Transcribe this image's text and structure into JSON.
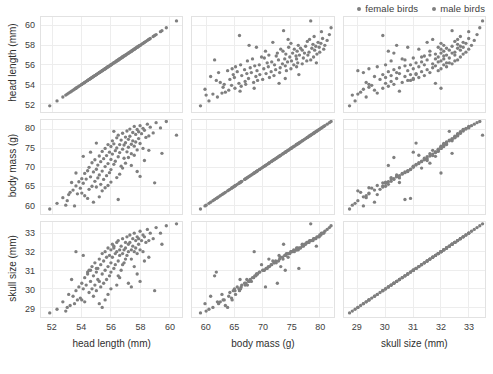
{
  "legend": {
    "position": "top-right",
    "color": "#7f7f7f",
    "entries": [
      {
        "label": "female birds",
        "marker": "dot-icon"
      },
      {
        "label": "male birds",
        "marker": "dot-icon"
      }
    ]
  },
  "chart_data": {
    "type": "scatter",
    "title": "",
    "layout": "scatterplot-matrix",
    "grid": true,
    "point_color": "#7f7f7f",
    "variables": [
      {
        "key": "head_length",
        "label": "head length (mm)",
        "ticks": [
          52,
          54,
          56,
          58,
          60
        ],
        "lim": [
          51.2,
          60.9
        ]
      },
      {
        "key": "body_mass",
        "label": "body mass (g)",
        "ticks": [
          60,
          65,
          70,
          75,
          80
        ],
        "lim": [
          57.5,
          82.5
        ]
      },
      {
        "key": "skull_size",
        "label": "skull size (mm)",
        "ticks": [
          29,
          30,
          31,
          32,
          33
        ],
        "lim": [
          28.5,
          33.6
        ]
      }
    ],
    "observations": [
      [
        51.8,
        59.0,
        28.7
      ],
      [
        52.3,
        60.5,
        28.9
      ],
      [
        52.7,
        62.0,
        29.3
      ],
      [
        53.0,
        61.2,
        29.0
      ],
      [
        53.2,
        63.4,
        29.1
      ],
      [
        53.4,
        64.0,
        29.6
      ],
      [
        53.5,
        59.8,
        29.2
      ],
      [
        53.6,
        65.1,
        29.9
      ],
      [
        53.7,
        63.0,
        29.4
      ],
      [
        53.8,
        66.2,
        30.1
      ],
      [
        53.9,
        64.5,
        29.5
      ],
      [
        54.0,
        67.0,
        30.3
      ],
      [
        54.1,
        65.8,
        30.0
      ],
      [
        54.2,
        68.4,
        30.6
      ],
      [
        54.2,
        62.5,
        29.3
      ],
      [
        54.3,
        66.9,
        30.2
      ],
      [
        54.4,
        69.1,
        30.8
      ],
      [
        54.5,
        64.2,
        29.8
      ],
      [
        54.5,
        70.0,
        31.0
      ],
      [
        54.6,
        67.5,
        30.4
      ],
      [
        54.7,
        65.0,
        30.0
      ],
      [
        54.7,
        71.2,
        31.2
      ],
      [
        54.8,
        68.8,
        30.7
      ],
      [
        54.9,
        66.3,
        30.2
      ],
      [
        54.9,
        72.0,
        31.4
      ],
      [
        55.0,
        69.5,
        30.9
      ],
      [
        55.0,
        64.8,
        29.9
      ],
      [
        55.1,
        70.6,
        31.1
      ],
      [
        55.1,
        67.2,
        30.5
      ],
      [
        55.2,
        73.0,
        31.6
      ],
      [
        55.2,
        68.0,
        30.4
      ],
      [
        55.3,
        71.5,
        31.3
      ],
      [
        55.3,
        65.5,
        30.1
      ],
      [
        55.4,
        74.2,
        31.9
      ],
      [
        55.4,
        69.0,
        30.8
      ],
      [
        55.5,
        72.3,
        31.5
      ],
      [
        55.5,
        66.8,
        30.3
      ],
      [
        55.6,
        75.0,
        32.0
      ],
      [
        55.6,
        70.2,
        31.0
      ],
      [
        55.7,
        73.1,
        31.7
      ],
      [
        55.7,
        67.8,
        30.5
      ],
      [
        55.8,
        76.0,
        32.2
      ],
      [
        55.8,
        71.0,
        31.2
      ],
      [
        55.9,
        74.0,
        31.8
      ],
      [
        55.9,
        68.6,
        30.7
      ],
      [
        56.0,
        75.5,
        32.1
      ],
      [
        56.0,
        72.1,
        31.4
      ],
      [
        56.0,
        69.4,
        30.9
      ],
      [
        56.1,
        77.0,
        32.4
      ],
      [
        56.1,
        73.5,
        31.7
      ],
      [
        56.2,
        70.8,
        31.1
      ],
      [
        56.2,
        76.2,
        32.2
      ],
      [
        56.3,
        74.4,
        31.9
      ],
      [
        56.3,
        71.6,
        31.3
      ],
      [
        56.4,
        77.8,
        32.5
      ],
      [
        56.4,
        75.1,
        32.0
      ],
      [
        56.5,
        72.8,
        31.5
      ],
      [
        56.5,
        78.5,
        32.6
      ],
      [
        56.6,
        76.0,
        32.1
      ],
      [
        56.6,
        73.9,
        31.8
      ],
      [
        56.7,
        70.3,
        31.0
      ],
      [
        56.7,
        77.2,
        32.3
      ],
      [
        56.8,
        74.8,
        31.9
      ],
      [
        56.8,
        79.0,
        32.7
      ],
      [
        56.9,
        75.9,
        32.1
      ],
      [
        56.9,
        72.4,
        31.4
      ],
      [
        57.0,
        78.0,
        32.5
      ],
      [
        57.0,
        76.5,
        32.2
      ],
      [
        57.1,
        74.1,
        31.8
      ],
      [
        57.1,
        79.6,
        32.8
      ],
      [
        57.2,
        77.4,
        32.4
      ],
      [
        57.2,
        75.3,
        32.0
      ],
      [
        57.3,
        80.1,
        32.9
      ],
      [
        57.3,
        78.2,
        32.5
      ],
      [
        57.4,
        76.1,
        32.1
      ],
      [
        57.4,
        73.6,
        31.6
      ],
      [
        57.5,
        79.2,
        32.7
      ],
      [
        57.5,
        77.0,
        32.3
      ],
      [
        57.6,
        80.8,
        33.0
      ],
      [
        57.6,
        75.6,
        32.0
      ],
      [
        57.7,
        78.7,
        32.6
      ],
      [
        57.7,
        76.7,
        32.2
      ],
      [
        57.8,
        80.0,
        32.8
      ],
      [
        57.8,
        74.6,
        31.9
      ],
      [
        57.9,
        79.4,
        32.7
      ],
      [
        57.9,
        77.6,
        32.4
      ],
      [
        58.0,
        81.0,
        33.1
      ],
      [
        58.0,
        76.3,
        32.1
      ],
      [
        58.1,
        78.9,
        32.6
      ],
      [
        58.2,
        80.3,
        32.9
      ],
      [
        58.2,
        75.0,
        32.0
      ],
      [
        58.3,
        79.8,
        32.8
      ],
      [
        58.4,
        77.9,
        32.5
      ],
      [
        58.5,
        81.4,
        33.2
      ],
      [
        58.6,
        78.3,
        32.6
      ],
      [
        58.7,
        80.6,
        33.0
      ],
      [
        58.9,
        79.1,
        32.7
      ],
      [
        59.1,
        81.8,
        33.3
      ],
      [
        59.4,
        80.4,
        33.0
      ],
      [
        59.8,
        82.1,
        33.4
      ],
      [
        60.5,
        78.5,
        33.5
      ],
      [
        52.9,
        60.0,
        28.8
      ],
      [
        53.1,
        62.8,
        29.7
      ],
      [
        53.3,
        66.0,
        30.5
      ],
      [
        54.0,
        63.2,
        29.4
      ],
      [
        54.4,
        61.8,
        30.9
      ],
      [
        54.6,
        74.0,
        31.0
      ],
      [
        54.8,
        60.8,
        29.6
      ],
      [
        55.0,
        76.4,
        31.1
      ],
      [
        55.2,
        62.2,
        29.2
      ],
      [
        55.4,
        63.8,
        29.0
      ],
      [
        55.6,
        64.6,
        29.4
      ],
      [
        55.8,
        65.2,
        29.7
      ],
      [
        56.0,
        66.1,
        30.0
      ],
      [
        56.2,
        79.5,
        32.3
      ],
      [
        56.4,
        67.3,
        30.2
      ],
      [
        56.6,
        68.2,
        30.6
      ],
      [
        56.8,
        69.8,
        31.3
      ],
      [
        57.0,
        71.1,
        31.6
      ],
      [
        57.2,
        72.6,
        30.3
      ],
      [
        57.4,
        70.5,
        30.1
      ],
      [
        57.6,
        73.2,
        31.2
      ],
      [
        57.8,
        68.9,
        30.8
      ],
      [
        58.0,
        67.6,
        30.4
      ],
      [
        58.3,
        71.8,
        31.5
      ],
      [
        58.6,
        74.5,
        31.7
      ],
      [
        59.0,
        65.9,
        29.9
      ],
      [
        59.5,
        73.7,
        32.4
      ],
      [
        53.6,
        68.5,
        32.0
      ],
      [
        54.1,
        72.9,
        31.8
      ],
      [
        56.5,
        61.5,
        30.7
      ]
    ]
  }
}
